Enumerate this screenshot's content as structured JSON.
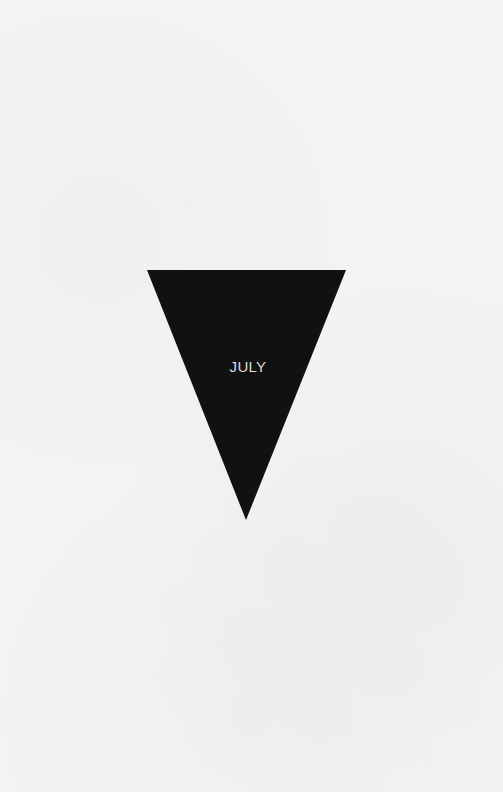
{
  "poster": {
    "background_color": "#f3f3f2",
    "pennant": {
      "shape": "inverted-triangle",
      "color": "#111111",
      "label": "JULY",
      "label_color": "#dcdcdc",
      "points": "147,270 346,270 246,520"
    }
  }
}
